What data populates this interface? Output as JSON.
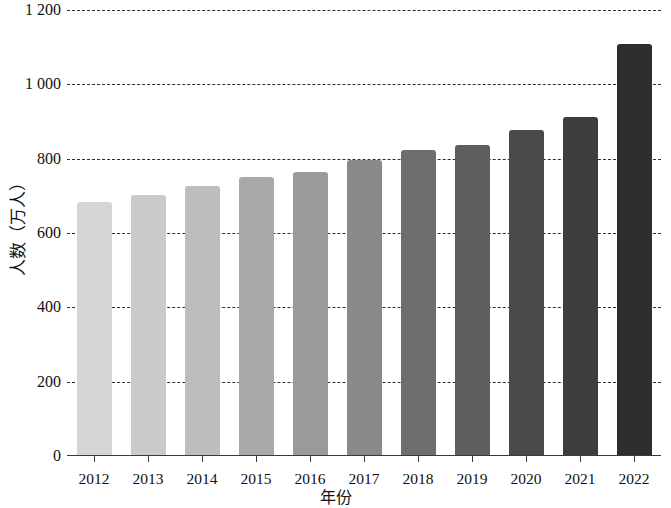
{
  "chart_data": {
    "type": "bar",
    "title": "",
    "subtitle": "",
    "xlabel": "年份",
    "ylabel": "人数（万人）",
    "categories": [
      "2012",
      "2013",
      "2014",
      "2015",
      "2016",
      "2017",
      "2018",
      "2019",
      "2020",
      "2021",
      "2022"
    ],
    "values": [
      681,
      699,
      724,
      748,
      762,
      795,
      820,
      834,
      875,
      910,
      1105
    ],
    "series": [
      {
        "name": "人数",
        "values": [
          681,
          699,
          724,
          748,
          762,
          795,
          820,
          834,
          875,
          910,
          1105
        ]
      }
    ],
    "ylim": [
      0,
      1200
    ],
    "ytick_values": [
      0,
      200,
      400,
      600,
      800,
      1000,
      1200
    ],
    "ytick_labels": [
      "0",
      "200",
      "400",
      "600",
      "800",
      "1 000",
      "1 200"
    ],
    "grid": true,
    "grid_style": "dashed-horizontal",
    "legend": "none",
    "bar_colors": [
      "#d5d5d5",
      "#cacaca",
      "#bdbdbd",
      "#a9a9a9",
      "#9a9a9a",
      "#8a8a8a",
      "#6e6e6e",
      "#5e5e5e",
      "#4a4a4a",
      "#3d3d3d",
      "#2e2e2e"
    ]
  }
}
